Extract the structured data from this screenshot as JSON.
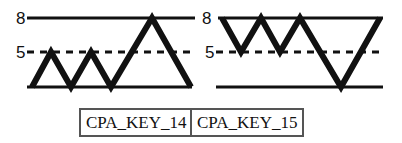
{
  "diagram": {
    "colors": {
      "line": "#111111",
      "border": "#555555"
    },
    "panels": [
      {
        "id": "left",
        "label": "CPA_KEY_14",
        "levels": {
          "top": "8",
          "mid": "5"
        },
        "points": "32,87 51,52 71,87 91,52 111,87 152,18 191,87"
      },
      {
        "id": "right",
        "label": "CPA_KEY_15",
        "levels": {
          "top": "8",
          "mid": "5"
        },
        "points": "222,18 241,52 261,18 280,52 300,18 341,87 380,18"
      }
    ]
  }
}
